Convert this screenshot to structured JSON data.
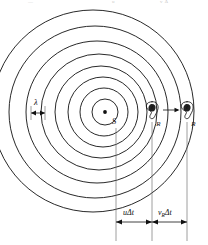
{
  "figure": {
    "type": "physics-diagram",
    "source_label": "S",
    "wavelength_label": "λ",
    "receiver_label_near": "R",
    "receiver_label_far": "R",
    "dimension_left_label": "uΔt",
    "dimension_right_base": "v",
    "dimension_right_sub": "R",
    "dimension_right_tail": "Δt"
  },
  "top_fragments": {
    "f1": "—",
    "f2": "u",
    "f3": "v  Δ"
  },
  "geometry": {
    "source_x": 105,
    "source_y": 112,
    "wavefront_radii": [
      13,
      24,
      35,
      46,
      58,
      71,
      86,
      101
    ],
    "receiver_near_x": 152,
    "receiver_far_x": 187,
    "dim_origin_x": 116,
    "dim_baseline_y": 222,
    "lambda_marker_x1": 31,
    "lambda_marker_x2": 45,
    "lambda_marker_y": 113
  },
  "colors": {
    "ink": "#111111",
    "paper": "#ffffff",
    "guide": "#6b6b6b"
  }
}
